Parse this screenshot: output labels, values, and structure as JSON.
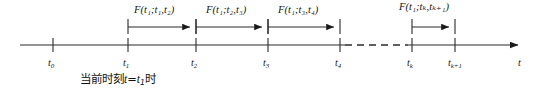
{
  "figure": {
    "type": "timeline-diagram",
    "axis": {
      "label": "t",
      "label_name": "time-axis-label",
      "start_x": 20,
      "end_x": 523,
      "y": 45,
      "arrow": "right",
      "color": "#1a1a1a",
      "dashed_gap": {
        "from_x": 345,
        "to_x": 408
      }
    },
    "ticks": [
      {
        "id": "t0",
        "x": 53,
        "label_main": "t",
        "label_sub": "0"
      },
      {
        "id": "t1",
        "x": 128,
        "label_main": "t",
        "label_sub": "1"
      },
      {
        "id": "t2",
        "x": 196,
        "label_main": "t",
        "label_sub": "2"
      },
      {
        "id": "t3",
        "x": 268,
        "label_main": "t",
        "label_sub": "3"
      },
      {
        "id": "t4",
        "x": 340,
        "label_main": "t",
        "label_sub": "4"
      },
      {
        "id": "tk",
        "x": 412,
        "label_main": "t",
        "label_sub": "k"
      },
      {
        "id": "tk1",
        "x": 455,
        "label_main": "t",
        "label_sub": "k+1"
      }
    ],
    "spans": [
      {
        "id": "span-t1-t2",
        "from_x": 128,
        "to_x": 196,
        "y": 28,
        "label_fn": "F",
        "label_args": "(t₁;t₁,t₂)",
        "label_text": "F(t1;t1,t2)"
      },
      {
        "id": "span-t2-t3",
        "from_x": 196,
        "to_x": 268,
        "y": 28,
        "label_fn": "F",
        "label_args": "(t₁;t₂,t₃)",
        "label_text": "F(t1;t2,t3)"
      },
      {
        "id": "span-t3-t4",
        "from_x": 268,
        "to_x": 340,
        "y": 28,
        "label_fn": "F",
        "label_args": "(t₁;t₃,t₄)",
        "label_text": "F(t1;t3,t4)"
      },
      {
        "id": "span-tk-tk1",
        "from_x": 412,
        "to_x": 455,
        "y": 28,
        "label_fn": "F",
        "label_args": "(t₁;tₖ,tₖ₊₁)",
        "label_text": "F(t1;tk,tk+1)"
      }
    ],
    "caption": {
      "prefix": "当前时刻",
      "var_left": "t",
      "equals": "=",
      "var_right_main": "t",
      "var_right_sub": "1",
      "suffix": "时",
      "full_text": "当前时刻t=t₁时"
    }
  }
}
